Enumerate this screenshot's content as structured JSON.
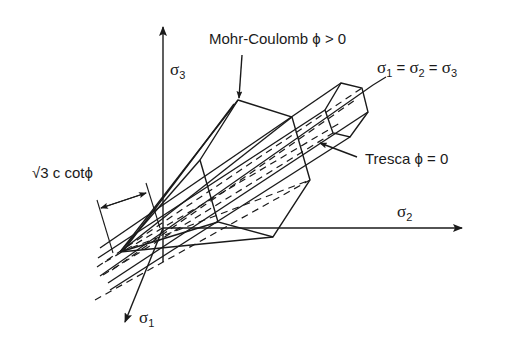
{
  "diagram": {
    "labels": {
      "mohr_coulomb": "Mohr-Coulomb ϕ > 0",
      "tresca": "Tresca ϕ = 0",
      "hydrostatic_axis": {
        "s1": "σ",
        "s1_sub": "1",
        "eq1": " = ",
        "s2": "σ",
        "s2_sub": "2",
        "eq2": " = ",
        "s3": "σ",
        "s3_sub": "3"
      },
      "apex_distance": "√3 c cotϕ",
      "axis_sigma1": {
        "sym": "σ",
        "sub": "1"
      },
      "axis_sigma2": {
        "sym": "σ",
        "sub": "2"
      },
      "axis_sigma3": {
        "sym": "σ",
        "sub": "3"
      }
    },
    "colors": {
      "ink": "#1a1a1a",
      "background": "#ffffff"
    },
    "elements": [
      "axis-sigma1",
      "axis-sigma2",
      "axis-sigma3",
      "hydrostatic-axis",
      "mohr-coulomb-pyramid",
      "tresca-prism",
      "apex-dimension-arrow"
    ]
  }
}
